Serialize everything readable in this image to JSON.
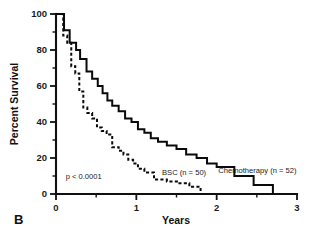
{
  "panel": {
    "label": "B"
  },
  "chart_data": {
    "type": "line",
    "subtype": "kaplan-meier-step",
    "title": "",
    "xlabel": "Years",
    "ylabel": "Percent Survival",
    "xlim": [
      0,
      3
    ],
    "ylim": [
      0,
      100
    ],
    "grid": false,
    "legend_position": "inline-annotation",
    "x_ticks_major": [
      0,
      1,
      2,
      3
    ],
    "x_ticks_major_labels": [
      "0",
      "1",
      "2",
      "3"
    ],
    "x_ticks_minor": [
      0.5,
      1.5,
      2.5
    ],
    "y_ticks_major": [
      0,
      20,
      40,
      60,
      80,
      100
    ],
    "y_ticks_major_labels": [
      "0",
      "20",
      "40",
      "60",
      "80",
      "100"
    ],
    "y_ticks_minor": [
      10,
      30,
      50,
      70,
      90
    ],
    "annotations": [
      {
        "name": "p-value",
        "text": "p < 0.0001",
        "x": 0.12,
        "y": 8.5
      },
      {
        "name": "bsc-label",
        "text": "BSC (n = 50)",
        "x": 1.32,
        "y": 10.5
      },
      {
        "name": "chemo-label",
        "text": "Chemotherapy (n = 52)",
        "x": 2.02,
        "y": 11.5
      }
    ],
    "series": [
      {
        "name": "Chemotherapy (n = 52)",
        "label": "Chemotherapy",
        "n": 52,
        "style": "solid",
        "color": "#0a0a0a",
        "x": [
          0.0,
          0.1,
          0.1,
          0.17,
          0.17,
          0.25,
          0.25,
          0.3,
          0.3,
          0.38,
          0.38,
          0.45,
          0.45,
          0.52,
          0.52,
          0.58,
          0.58,
          0.64,
          0.64,
          0.7,
          0.7,
          0.78,
          0.78,
          0.86,
          0.86,
          0.94,
          0.94,
          1.02,
          1.02,
          1.1,
          1.1,
          1.18,
          1.18,
          1.27,
          1.27,
          1.38,
          1.38,
          1.5,
          1.5,
          1.62,
          1.62,
          1.75,
          1.75,
          1.88,
          1.88,
          2.0,
          2.0,
          2.22,
          2.22,
          2.46,
          2.46,
          2.7,
          2.7
        ],
        "y": [
          100,
          100,
          91,
          91,
          84,
          84,
          80,
          80,
          75,
          75,
          68,
          68,
          64,
          64,
          60,
          60,
          56,
          56,
          52,
          52,
          49,
          49,
          46,
          46,
          42,
          42,
          40,
          40,
          36,
          36,
          34,
          34,
          31,
          31,
          29,
          29,
          27,
          27,
          25,
          25,
          22,
          22,
          20,
          20,
          17,
          17,
          15,
          15,
          10,
          10,
          5,
          5,
          0
        ]
      },
      {
        "name": "BSC (n = 50)",
        "label": "BSC",
        "n": 50,
        "style": "dashed",
        "color": "#0a0a0a",
        "x": [
          0.0,
          0.09,
          0.09,
          0.14,
          0.14,
          0.19,
          0.19,
          0.24,
          0.24,
          0.29,
          0.29,
          0.34,
          0.34,
          0.39,
          0.39,
          0.45,
          0.45,
          0.51,
          0.51,
          0.57,
          0.57,
          0.63,
          0.63,
          0.7,
          0.7,
          0.78,
          0.78,
          0.84,
          0.84,
          0.9,
          0.9,
          0.96,
          0.96,
          1.02,
          1.02,
          1.1,
          1.1,
          1.22,
          1.22,
          1.38,
          1.38,
          1.52,
          1.52,
          1.66,
          1.66,
          1.8,
          1.8
        ],
        "y": [
          100,
          100,
          88,
          88,
          84,
          84,
          71,
          71,
          67,
          67,
          57,
          57,
          48,
          48,
          45,
          45,
          42,
          42,
          37,
          37,
          35,
          35,
          33,
          33,
          26,
          26,
          24,
          24,
          22,
          22,
          19,
          19,
          17,
          17,
          14,
          14,
          12,
          12,
          8,
          8,
          7,
          7,
          6,
          6,
          4,
          4,
          0
        ]
      }
    ]
  }
}
